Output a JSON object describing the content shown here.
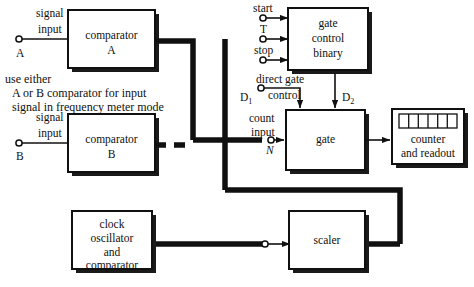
{
  "diagram": {
    "colors": {
      "line": "#101010",
      "shadow": "#1a1a1a",
      "block_fill": "#ffffff",
      "background": "#ffffff"
    },
    "blocks": [
      {
        "id": "comparator-a",
        "lines": [
          "comparator",
          "A"
        ]
      },
      {
        "id": "comparator-b",
        "lines": [
          "comparator",
          "B"
        ]
      },
      {
        "id": "gate-control-binary",
        "lines": [
          "gate",
          "control",
          "binary"
        ]
      },
      {
        "id": "gate",
        "lines": [
          "gate"
        ]
      },
      {
        "id": "counter-and-readout",
        "lines": [
          "counter",
          "and readout"
        ]
      },
      {
        "id": "clock-oscillator",
        "lines": [
          "clock",
          "oscillator",
          "and",
          "comparator"
        ]
      },
      {
        "id": "scaler",
        "lines": [
          "scaler"
        ]
      }
    ],
    "readout": {
      "cells": 6
    },
    "terminals": [
      {
        "id": "signal-input-a",
        "label_lines": [
          "signal",
          "input"
        ],
        "name": "A"
      },
      {
        "id": "signal-input-b",
        "label_lines": [
          "signal",
          "input"
        ],
        "name": "B"
      },
      {
        "id": "start",
        "label_lines": [
          "start"
        ],
        "name": ""
      },
      {
        "id": "t",
        "label_lines": [
          "T"
        ],
        "name": ""
      },
      {
        "id": "stop",
        "label_lines": [
          "stop"
        ],
        "name": ""
      },
      {
        "id": "direct-gate-control",
        "label_lines": [
          "direct gate",
          "control"
        ],
        "name": "D1"
      },
      {
        "id": "count-input",
        "label_lines": [
          "count",
          "input"
        ],
        "name": "N"
      }
    ],
    "labels": {
      "signal": "signal",
      "input": "input",
      "a": "A",
      "b": "B",
      "start": "start",
      "t": "T",
      "stop": "stop",
      "direct_gate": "direct gate",
      "control": "control",
      "d1_base": "D",
      "d1_sub": "1",
      "d2_base": "D",
      "d2_sub": "2",
      "count": "count",
      "count_input": "input",
      "n": "N",
      "note_line1": "use either",
      "note_line2": "A or B comparator for input",
      "note_line3": "signal in frequency meter mode",
      "comparator": "comparator",
      "gate_word": "gate",
      "control_word": "control",
      "binary": "binary",
      "counter": "counter",
      "and_readout": "and readout",
      "clock": "clock",
      "oscillator": "oscillator",
      "and": "and",
      "scaler": "scaler"
    }
  }
}
